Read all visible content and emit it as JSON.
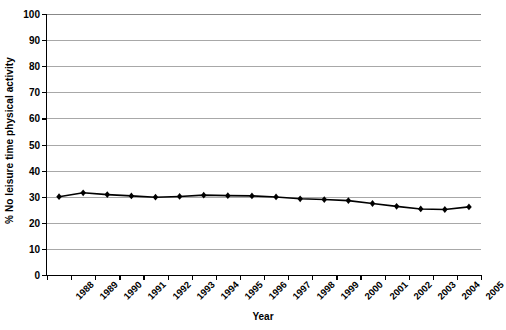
{
  "chart_data": {
    "type": "line",
    "title": "",
    "xlabel": "Year",
    "ylabel": "% No leisure time physical activity",
    "categories": [
      "1988",
      "1989",
      "1990",
      "1991",
      "1992",
      "1993",
      "1994",
      "1995",
      "1996",
      "1997",
      "1998",
      "1999",
      "2000",
      "2001",
      "2002",
      "2003",
      "2004",
      "2005"
    ],
    "values": [
      30.0,
      31.5,
      30.8,
      30.3,
      29.8,
      30.1,
      30.6,
      30.4,
      30.3,
      29.9,
      29.2,
      28.9,
      28.5,
      27.4,
      26.3,
      25.3,
      25.1,
      26.1
    ],
    "ylim": [
      0,
      100
    ],
    "ytick_labels": [
      "100",
      "90",
      "80",
      "70",
      "60",
      "50",
      "40",
      "30",
      "20",
      "10",
      "0"
    ],
    "ytick_values": [
      100,
      90,
      80,
      70,
      60,
      50,
      40,
      30,
      20,
      10,
      0
    ],
    "grid": true,
    "legend": "none",
    "series_color": "#000000",
    "grid_color": "#a8a8a8",
    "axis_color": "#000000",
    "marker": "diamond"
  }
}
